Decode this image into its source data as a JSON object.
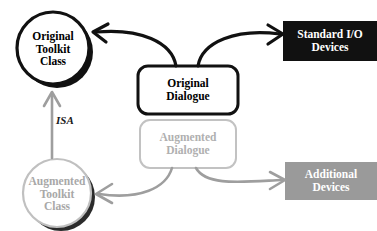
{
  "diagram": {
    "colors": {
      "black": "#111111",
      "gray": "#9a9a9a",
      "light_gray": "#b5b5b5",
      "shadow_gray": "#4a4a4a",
      "white": "#ffffff",
      "background": "#ffffff"
    },
    "nodes": [
      {
        "id": "original-toolkit-class",
        "shape": "circle",
        "lines": [
          "Original",
          "Toolkit",
          "Class"
        ],
        "style": "black-outline-with-shadow"
      },
      {
        "id": "augmented-toolkit-class",
        "shape": "circle",
        "lines": [
          "Augmented",
          "Toolkit",
          "Class"
        ],
        "style": "gray-outline-with-shadow"
      },
      {
        "id": "original-dialogue",
        "shape": "rounded-rectangle",
        "lines": [
          "Original",
          "Dialogue"
        ],
        "style": "black-outline"
      },
      {
        "id": "augmented-dialogue",
        "shape": "rounded-rectangle",
        "lines": [
          "Augmented",
          "Dialogue"
        ],
        "style": "gray-outline"
      },
      {
        "id": "standard-io-devices",
        "shape": "rectangle",
        "lines": [
          "Standard I/O",
          "Devices"
        ],
        "style": "black-filled"
      },
      {
        "id": "additional-devices",
        "shape": "rectangle",
        "lines": [
          "Additional",
          "Devices"
        ],
        "style": "gray-filled"
      }
    ],
    "edges": [
      {
        "id": "original-dialogue-to-original-toolkit",
        "from": "original-dialogue",
        "to": "original-toolkit-class",
        "style": "black-curve",
        "label": ""
      },
      {
        "id": "original-dialogue-to-standard-io",
        "from": "original-dialogue",
        "to": "standard-io-devices",
        "style": "black-curve",
        "label": ""
      },
      {
        "id": "augmented-dialogue-to-augmented-toolkit",
        "from": "augmented-dialogue",
        "to": "augmented-toolkit-class",
        "style": "gray-curve",
        "label": ""
      },
      {
        "id": "augmented-dialogue-to-additional-devices",
        "from": "augmented-dialogue",
        "to": "additional-devices",
        "style": "gray-curve",
        "label": ""
      },
      {
        "id": "augmented-toolkit-to-original-toolkit",
        "from": "augmented-toolkit-class",
        "to": "original-toolkit-class",
        "style": "gray-straight",
        "label": "ISA"
      }
    ],
    "edge_labels": {
      "isa": "ISA"
    }
  }
}
